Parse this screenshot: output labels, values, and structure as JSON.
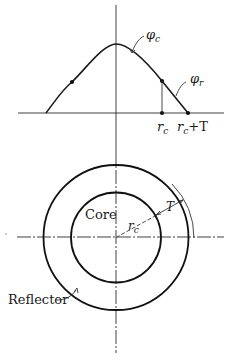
{
  "figure": {
    "flux_plot": {
      "labels": {
        "phi_core": "φ",
        "phi_core_sub": "c",
        "phi_reflector": "φ",
        "phi_reflector_sub": "r",
        "r_core": "r",
        "r_core_sub": "c",
        "r_core_plus_T": "r",
        "r_core_plus_T_sub": "c",
        "r_core_plus_T_suffix": "+T"
      }
    },
    "cross_section": {
      "labels": {
        "core": "Core",
        "reflector": "Reflector",
        "core_radius": "r",
        "core_radius_sub": "c",
        "thickness": "T"
      }
    }
  }
}
